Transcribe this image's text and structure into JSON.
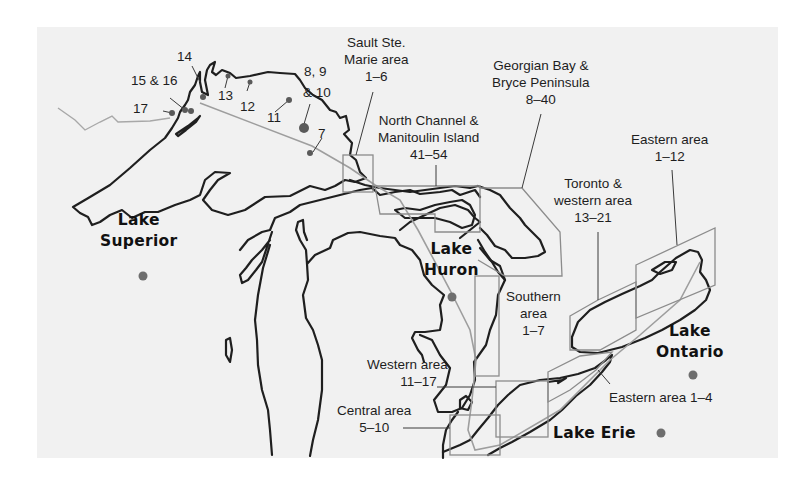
{
  "map": {
    "background_color": "#f1f1f1",
    "coast_color": "#1f1f1f",
    "box_color": "#8c8c8c",
    "dot_color": "#6e6e6e",
    "lakes": {
      "superior": {
        "line1": "Lake",
        "line2": "Superior"
      },
      "huron": {
        "line1": "Lake",
        "line2": "Huron"
      },
      "ontario": {
        "line1": "Lake",
        "line2": "Ontario"
      },
      "erie": {
        "line1": "Lake Erie"
      }
    },
    "superior_points": {
      "p7": "7",
      "p8_10_line1": "8, 9",
      "p8_10_line2": "& 10",
      "p11": "11",
      "p12": "12",
      "p13": "13",
      "p14": "14",
      "p15_16": "15 & 16",
      "p17": "17"
    },
    "areas": {
      "sault": {
        "line1": "Sault Ste.",
        "line2": "Marie area",
        "range": "1–6"
      },
      "north_channel": {
        "line1": "North Channel &",
        "line2": "Manitoulin Island",
        "range": "41–54"
      },
      "georgian": {
        "line1": "Georgian Bay &",
        "line2": "Bryce Peninsula",
        "range": "8–40"
      },
      "ontario_east": {
        "line1": "Eastern area",
        "range": "1–12"
      },
      "toronto": {
        "line1": "Toronto &",
        "line2": "western area",
        "range": "13–21"
      },
      "huron_south": {
        "line1": "Southern",
        "line2": "area",
        "range": "1–7"
      },
      "erie_west": {
        "line1": "Western area",
        "range": "11–17"
      },
      "erie_central": {
        "line1": "Central area",
        "range": "5–10"
      },
      "erie_east": {
        "line1": "Eastern area 1–4"
      }
    }
  }
}
